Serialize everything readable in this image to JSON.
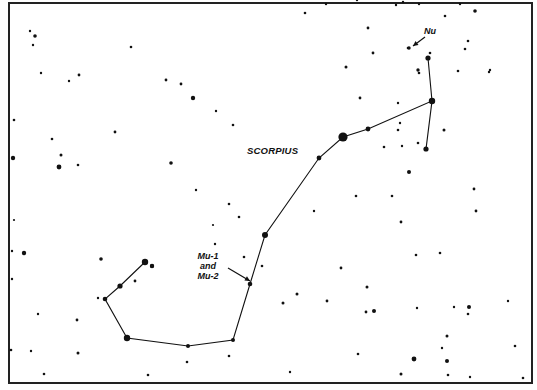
{
  "chart": {
    "title": "SCORPIUS",
    "frame": {
      "x": 9,
      "y": 3,
      "w": 523,
      "h": 380,
      "color": "#222222"
    },
    "labels": {
      "constellation": "SCORPIUS",
      "nu": "Nu",
      "mu_line1": "Mu-1",
      "mu_line2": "and",
      "mu_line3": "Mu-2"
    },
    "constellation_path": [
      [
        145,
        262
      ],
      [
        120,
        286
      ],
      [
        105,
        299
      ],
      [
        127,
        338
      ],
      [
        188,
        346
      ],
      [
        233,
        340
      ],
      [
        250,
        284
      ],
      [
        265,
        235
      ],
      [
        319,
        158
      ],
      [
        343,
        137
      ],
      [
        368,
        129
      ],
      [
        432,
        101
      ],
      [
        428,
        58
      ]
    ],
    "constellation_branch": [
      [
        432,
        101
      ],
      [
        426,
        149
      ]
    ],
    "stars": [
      [
        30,
        31,
        1.2
      ],
      [
        35,
        36,
        1.8
      ],
      [
        33,
        45,
        1.2
      ],
      [
        41,
        73,
        1.2
      ],
      [
        69,
        81,
        1.2
      ],
      [
        79,
        75,
        1.4
      ],
      [
        131,
        47,
        1.3
      ],
      [
        166,
        80,
        1.4
      ],
      [
        181,
        84,
        1.4
      ],
      [
        193,
        98,
        2.2
      ],
      [
        14,
        120,
        1.3
      ],
      [
        13,
        158,
        2.2
      ],
      [
        52,
        139,
        1.3
      ],
      [
        61,
        155,
        1.5
      ],
      [
        59,
        167,
        2.4
      ],
      [
        78,
        165,
        1.3
      ],
      [
        115,
        132,
        1.4
      ],
      [
        171,
        163,
        1.8
      ],
      [
        196,
        190,
        1.2
      ],
      [
        213,
        225,
        1.1
      ],
      [
        24,
        253,
        2.2
      ],
      [
        12,
        251,
        1.2
      ],
      [
        12,
        279,
        1.2
      ],
      [
        14,
        220,
        1.1
      ],
      [
        38,
        314,
        1.2
      ],
      [
        77,
        320,
        1.4
      ],
      [
        101,
        259,
        1.8
      ],
      [
        135,
        281,
        1.4
      ],
      [
        98,
        298,
        1.2
      ],
      [
        152,
        266,
        2.0
      ],
      [
        11,
        350,
        1.3
      ],
      [
        31,
        351,
        1.2
      ],
      [
        44,
        374,
        1.3
      ],
      [
        78,
        353,
        1.5
      ],
      [
        148,
        375,
        1.3
      ],
      [
        187,
        362,
        1.3
      ],
      [
        229,
        356,
        1.3
      ],
      [
        262,
        266,
        1.3
      ],
      [
        244,
        257,
        1.3
      ],
      [
        215,
        244,
        1.2
      ],
      [
        239,
        217,
        1.3
      ],
      [
        229,
        204,
        1.3
      ],
      [
        305,
        13,
        1.3
      ],
      [
        368,
        28,
        1.4
      ],
      [
        373,
        53,
        1.4
      ],
      [
        346,
        67,
        1.5
      ],
      [
        360,
        98,
        1.4
      ],
      [
        233,
        125,
        1.3
      ],
      [
        216,
        111,
        1.2
      ],
      [
        408,
        48,
        1.3
      ],
      [
        418,
        70,
        1.7
      ],
      [
        419,
        73,
        1.3
      ],
      [
        445,
        16,
        1.3
      ],
      [
        465,
        49,
        1.3
      ],
      [
        475,
        11,
        1.8
      ],
      [
        468,
        41,
        1.3
      ],
      [
        458,
        71,
        1.3
      ],
      [
        489,
        72,
        1.2
      ],
      [
        490,
        70,
        1.2
      ],
      [
        398,
        103,
        1.2
      ],
      [
        400,
        123,
        1.2
      ],
      [
        398,
        130,
        1.3
      ],
      [
        444,
        130,
        1.5
      ],
      [
        402,
        146,
        1.2
      ],
      [
        384,
        147,
        1.3
      ],
      [
        418,
        143,
        1.3
      ],
      [
        409,
        172,
        2.0
      ],
      [
        474,
        189,
        1.4
      ],
      [
        476,
        211,
        1.4
      ],
      [
        401,
        222,
        1.4
      ],
      [
        416,
        255,
        1.3
      ],
      [
        440,
        253,
        1.3
      ],
      [
        367,
        287,
        1.5
      ],
      [
        366,
        312,
        1.4
      ],
      [
        374,
        311,
        2.0
      ],
      [
        417,
        308,
        1.2
      ],
      [
        454,
        307,
        1.2
      ],
      [
        468,
        314,
        1.3
      ],
      [
        469,
        307,
        2.0
      ],
      [
        447,
        336,
        1.5
      ],
      [
        442,
        348,
        1.2
      ],
      [
        515,
        346,
        1.3
      ],
      [
        358,
        354,
        1.3
      ],
      [
        414,
        359,
        2.4
      ],
      [
        447,
        361,
        2.0
      ],
      [
        448,
        375,
        1.3
      ],
      [
        470,
        377,
        1.2
      ],
      [
        401,
        374,
        1.5
      ],
      [
        326,
        4,
        1.2
      ],
      [
        396,
        5,
        1.2
      ],
      [
        357,
        0,
        1.2
      ],
      [
        392,
        196,
        1.3
      ],
      [
        356,
        196,
        1.3
      ],
      [
        460,
        4,
        1.2
      ],
      [
        403,
        2,
        1.2
      ],
      [
        419,
        4,
        1.2
      ],
      [
        290,
        372,
        1.2
      ],
      [
        314,
        211,
        1.2
      ],
      [
        283,
        303,
        1.5
      ],
      [
        297,
        294,
        1.5
      ],
      [
        341,
        268,
        1.4
      ],
      [
        327,
        301,
        1.4
      ],
      [
        508,
        301,
        1.2
      ],
      [
        523,
        378,
        1.3
      ],
      [
        430,
        53,
        1.3
      ]
    ],
    "constellation_stars": [
      [
        145,
        262,
        3.2
      ],
      [
        152,
        266,
        2.2
      ],
      [
        120,
        286,
        2.6
      ],
      [
        105,
        299,
        2.3
      ],
      [
        127,
        338,
        3.2
      ],
      [
        188,
        346,
        2.0
      ],
      [
        233,
        340,
        2.0
      ],
      [
        250,
        284,
        2.3
      ],
      [
        265,
        235,
        3.0
      ],
      [
        319,
        158,
        2.4
      ],
      [
        343,
        137,
        4.6
      ],
      [
        368,
        129,
        2.4
      ],
      [
        432,
        101,
        3.2
      ],
      [
        428,
        58,
        2.6
      ],
      [
        426,
        149,
        2.6
      ],
      [
        409,
        48,
        1.7
      ]
    ],
    "arrows": [
      {
        "from": [
          425,
          37
        ],
        "to": [
          413,
          46
        ]
      },
      {
        "from": [
          228,
          268
        ],
        "to": [
          250,
          281
        ]
      }
    ]
  }
}
